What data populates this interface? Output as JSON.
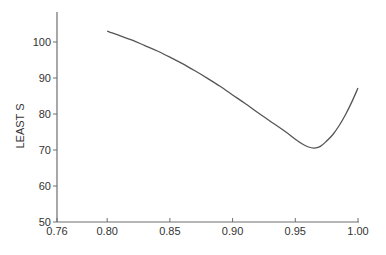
{
  "chart_data": {
    "type": "line",
    "title": "",
    "xlabel": "",
    "ylabel": "LEAST S",
    "xlim": [
      0.76,
      1.0
    ],
    "ylim": [
      50,
      108
    ],
    "grid": false,
    "legend": null,
    "xticks": [
      0.76,
      0.8,
      0.85,
      0.9,
      0.95,
      1.0
    ],
    "xtick_labels": [
      "0.76",
      "0.80",
      "0.85",
      "0.90",
      "0.95",
      "1.00"
    ],
    "yticks": [
      50,
      60,
      70,
      80,
      90,
      100
    ],
    "ytick_labels": [
      "50",
      "60",
      "70",
      "80",
      "90",
      "100"
    ],
    "series": [
      {
        "name": "LEAST S",
        "color": "#555555",
        "x": [
          0.8,
          0.81,
          0.82,
          0.83,
          0.84,
          0.85,
          0.86,
          0.87,
          0.88,
          0.89,
          0.9,
          0.91,
          0.92,
          0.93,
          0.94,
          0.95,
          0.955,
          0.96,
          0.965,
          0.97,
          0.975,
          0.98,
          0.985,
          0.99,
          0.995,
          1.0
        ],
        "values": [
          103.0,
          101.8,
          100.5,
          99.0,
          97.5,
          95.8,
          94.0,
          92.0,
          89.9,
          87.7,
          85.3,
          82.9,
          80.4,
          78.0,
          75.6,
          73.0,
          71.8,
          70.9,
          70.5,
          71.0,
          72.5,
          74.3,
          76.8,
          79.8,
          83.3,
          87.2
        ]
      }
    ]
  }
}
